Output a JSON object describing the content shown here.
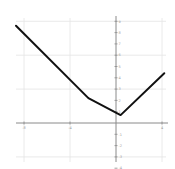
{
  "chart_data": {
    "type": "line",
    "title": "",
    "xlabel": "",
    "ylabel": "",
    "xlim": [
      -9,
      4.5
    ],
    "ylim": [
      -4,
      9.5
    ],
    "grid": true,
    "legend": null,
    "x_ticks": [
      -8,
      -4,
      0,
      4
    ],
    "x_tick_labels": [
      "-8",
      "-4",
      "0",
      "4"
    ],
    "y_ticks": [
      -4,
      -3,
      -2,
      -1,
      1,
      2,
      3,
      4,
      5,
      6,
      7,
      8,
      9
    ],
    "series": [
      {
        "name": "piecewise linear function",
        "color": "#111111",
        "points": [
          {
            "x": -8.7,
            "y": 8.6
          },
          {
            "x": -2.4,
            "y": 2.2
          },
          {
            "x": 0.4,
            "y": 0.7
          },
          {
            "x": 4.2,
            "y": 4.4
          }
        ]
      }
    ]
  },
  "colors": {
    "background": "#ffffff",
    "grid": "#e4e4e4",
    "axis": "#8a8a8a",
    "line": "#111111"
  }
}
